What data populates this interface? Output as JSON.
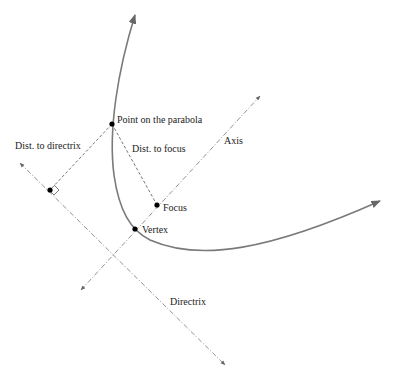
{
  "diagram": {
    "type": "parabola-definition",
    "labels": {
      "point": "Point on the parabola",
      "dist_directrix": "Dist. to directrix",
      "dist_focus": "Dist. to focus",
      "axis": "Axis",
      "focus": "Focus",
      "vertex": "Vertex",
      "directrix": "Directrix"
    },
    "colors": {
      "curve": "#7a7a7a",
      "guide": "#777777",
      "point": "#000000",
      "text": "#222222"
    }
  }
}
